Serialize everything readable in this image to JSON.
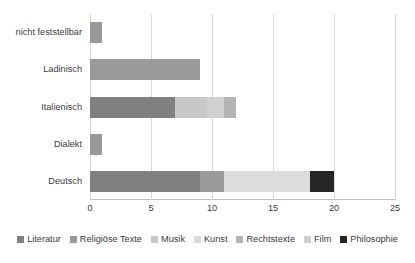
{
  "chart_data": {
    "type": "bar",
    "orientation": "horizontal",
    "stacked": true,
    "title": "",
    "xlabel": "",
    "ylabel": "",
    "xlim": [
      0,
      25
    ],
    "xticks": [
      0,
      5,
      10,
      15,
      20,
      25
    ],
    "xtick_labels": [
      "0",
      "5",
      "10",
      "15",
      "20",
      "25"
    ],
    "grid": true,
    "legend_position": "bottom",
    "categories": [
      "Deutsch",
      "Dialekt",
      "Italienisch",
      "Ladinisch",
      "nicht feststellbar"
    ],
    "series": [
      {
        "name": "Literatur",
        "color": "#808080",
        "values": [
          9,
          0,
          7,
          0,
          0
        ]
      },
      {
        "name": "Religiöse Texte",
        "color": "#9a9a9a",
        "values": [
          2,
          1,
          0,
          9,
          1
        ]
      },
      {
        "name": "Musik",
        "color": "#c8c8c8",
        "values": [
          0,
          0,
          2.5,
          0,
          0
        ]
      },
      {
        "name": "Kunst",
        "color": "#dcdcdc",
        "values": [
          7,
          0,
          0,
          0,
          0
        ]
      },
      {
        "name": "Rechtstexte",
        "color": "#b4b4b4",
        "values": [
          0,
          0,
          1,
          0,
          0
        ]
      },
      {
        "name": "Film",
        "color": "#d0d0d0",
        "values": [
          0,
          0,
          1.5,
          0,
          0
        ]
      },
      {
        "name": "Philosophie",
        "color": "#262626",
        "values": [
          2,
          0,
          0,
          0,
          0
        ]
      }
    ],
    "totals": [
      20,
      1,
      12,
      9,
      1
    ],
    "stacks": [
      {
        "category": "Deutsch",
        "segments": [
          {
            "series": "Literatur",
            "start": 0,
            "end": 9,
            "color": "#808080"
          },
          {
            "series": "Religiöse Texte",
            "start": 9,
            "end": 11,
            "color": "#9a9a9a"
          },
          {
            "series": "Kunst",
            "start": 11,
            "end": 18,
            "color": "#dcdcdc"
          },
          {
            "series": "Philosophie",
            "start": 18,
            "end": 20,
            "color": "#262626"
          }
        ]
      },
      {
        "category": "Dialekt",
        "segments": [
          {
            "series": "Religiöse Texte",
            "start": 0,
            "end": 1,
            "color": "#9a9a9a"
          }
        ]
      },
      {
        "category": "Italienisch",
        "segments": [
          {
            "series": "Literatur",
            "start": 0,
            "end": 7,
            "color": "#808080"
          },
          {
            "series": "Musik",
            "start": 7,
            "end": 9.5,
            "color": "#c8c8c8"
          },
          {
            "series": "Film",
            "start": 9.5,
            "end": 11,
            "color": "#d0d0d0"
          },
          {
            "series": "Rechtstexte",
            "start": 11,
            "end": 12,
            "color": "#b4b4b4"
          }
        ]
      },
      {
        "category": "Ladinisch",
        "segments": [
          {
            "series": "Religiöse Texte",
            "start": 0,
            "end": 9,
            "color": "#9a9a9a"
          }
        ]
      },
      {
        "category": "nicht feststellbar",
        "segments": [
          {
            "series": "Religiöse Texte",
            "start": 0,
            "end": 1,
            "color": "#9a9a9a"
          }
        ]
      }
    ]
  },
  "axis": {
    "ticks": [
      {
        "label": "0"
      },
      {
        "label": "5"
      },
      {
        "label": "10"
      },
      {
        "label": "15"
      },
      {
        "label": "20"
      },
      {
        "label": "25"
      }
    ]
  },
  "categories": [
    {
      "label": "nicht feststellbar"
    },
    {
      "label": "Ladinisch"
    },
    {
      "label": "Italienisch"
    },
    {
      "label": "Dialekt"
    },
    {
      "label": "Deutsch"
    }
  ],
  "legend": {
    "items": [
      {
        "label": "Literatur",
        "color": "#808080"
      },
      {
        "label": "Religiöse Texte",
        "color": "#9a9a9a"
      },
      {
        "label": "Musik",
        "color": "#c8c8c8"
      },
      {
        "label": "Kunst",
        "color": "#dcdcdc"
      },
      {
        "label": "Rechtstexte",
        "color": "#b4b4b4"
      },
      {
        "label": "Film",
        "color": "#d0d0d0"
      },
      {
        "label": "Philosophie",
        "color": "#262626"
      }
    ]
  }
}
